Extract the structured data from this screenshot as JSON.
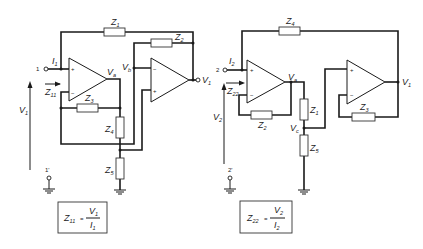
{
  "left_circuit": {
    "title_formula": {
      "lhs": "Z",
      "lhs_sub": "11",
      "eq": "=",
      "num": "V",
      "num_sub": "1",
      "den": "I",
      "den_sub": "1"
    },
    "terminal_in": "1",
    "terminal_gnd": "1'",
    "current": {
      "sym": "I",
      "sub": "1"
    },
    "input_impedance": {
      "sym": "Z",
      "sub": "11"
    },
    "input_voltage": {
      "sym": "V",
      "sub": "1"
    },
    "node_va": {
      "sym": "V",
      "sub": "a"
    },
    "node_vb": {
      "sym": "V",
      "sub": "b"
    },
    "output": {
      "sym": "V",
      "sub": "1"
    },
    "Z1": {
      "sym": "Z",
      "sub": "1"
    },
    "Z2": {
      "sym": "Z",
      "sub": "2"
    },
    "Z3": {
      "sym": "Z",
      "sub": "3"
    },
    "Z4": {
      "sym": "Z",
      "sub": "4"
    },
    "Z5": {
      "sym": "Z",
      "sub": "5"
    },
    "plus": "+",
    "minus": "−"
  },
  "right_circuit": {
    "title_formula": {
      "lhs": "Z",
      "lhs_sub": "22",
      "eq": "=",
      "num": "V",
      "num_sub": "2",
      "den": "I",
      "den_sub": "2"
    },
    "terminal_in": "2",
    "terminal_gnd": "2'",
    "current": {
      "sym": "I",
      "sub": "2"
    },
    "input_impedance": {
      "sym": "Z",
      "sub": "22"
    },
    "input_voltage": {
      "sym": "V",
      "sub": "2"
    },
    "node_va": {
      "sym": "V",
      "sub": "a"
    },
    "node_vc": {
      "sym": "V",
      "sub": "c"
    },
    "output": {
      "sym": "V",
      "sub": "1"
    },
    "Z1": {
      "sym": "Z",
      "sub": "1"
    },
    "Z2": {
      "sym": "Z",
      "sub": "2"
    },
    "Z3": {
      "sym": "Z",
      "sub": "3"
    },
    "Z4": {
      "sym": "Z",
      "sub": "4"
    },
    "Z5": {
      "sym": "Z",
      "sub": "5"
    },
    "plus": "+",
    "minus": "−"
  }
}
